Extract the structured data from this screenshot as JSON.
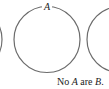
{
  "diagram": {
    "type": "venn",
    "circles": [
      {
        "id": "left",
        "label": "",
        "cx": -31,
        "cy": 39.5,
        "r": 33,
        "partial": true
      },
      {
        "id": "A",
        "label": "A",
        "cx": 47,
        "cy": 39.5,
        "r": 33,
        "partial": false
      },
      {
        "id": "right",
        "label": "",
        "cx": 120,
        "cy": 39.5,
        "r": 33,
        "partial": true
      }
    ],
    "stroke_color": "#6b6b6b"
  },
  "caption": {
    "prefix": "No ",
    "term_a": "A",
    "middle": " are ",
    "term_b": "B",
    "suffix": "."
  }
}
